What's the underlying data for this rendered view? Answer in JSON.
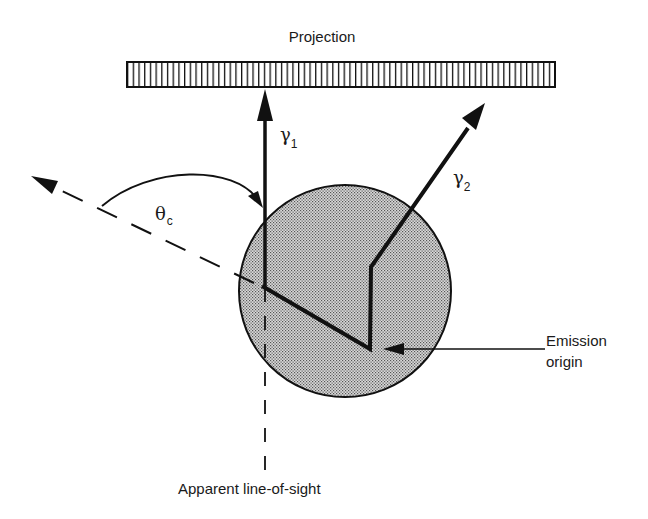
{
  "diagram": {
    "projection_label": "Projection",
    "gamma1": {
      "symbol": "γ",
      "subscript": "1"
    },
    "gamma2": {
      "symbol": "γ",
      "subscript": "2"
    },
    "theta": {
      "symbol": "θ",
      "subscript": "c"
    },
    "emission_origin": {
      "line1": "Emission",
      "line2": "origin"
    },
    "line_of_sight_label": "Apparent line-of-sight"
  },
  "colors": {
    "ink": "#111111",
    "sphere_fill": "#c8c8c8",
    "sphere_dot": "#555555",
    "background": "#ffffff"
  }
}
